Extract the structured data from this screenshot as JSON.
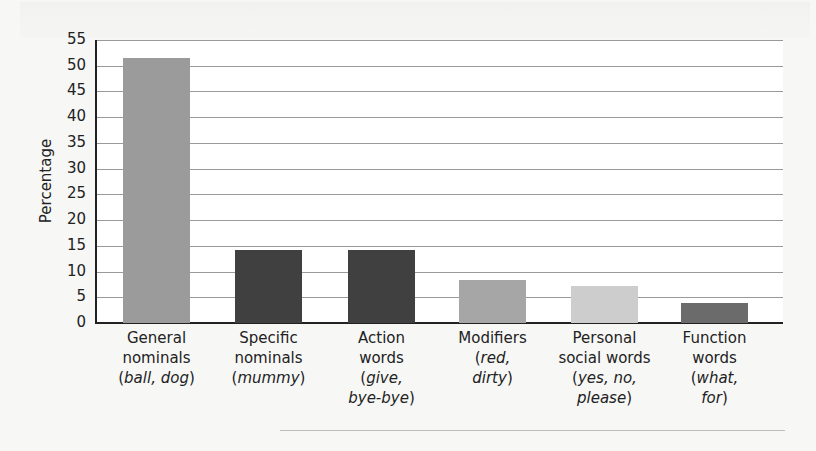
{
  "chart_data": {
    "type": "bar",
    "title": "",
    "xlabel": "",
    "ylabel": "Percentage",
    "ylim": [
      0,
      55
    ],
    "yticks": [
      0,
      5,
      10,
      15,
      20,
      25,
      30,
      35,
      40,
      45,
      50,
      55
    ],
    "grid": true,
    "legend": null,
    "categories": [
      "General nominals (ball, dog)",
      "Specific nominals (mummy)",
      "Action words (give, bye-bye)",
      "Modifiers (red, dirty)",
      "Personal social words (yes, no, please)",
      "Function words (what, for)"
    ],
    "values": [
      51.5,
      14.2,
      14.2,
      8.3,
      7.1,
      3.8
    ],
    "bar_colors": [
      "#9b9b9b",
      "#404040",
      "#404040",
      "#a6a6a6",
      "#cdcdcd",
      "#6b6b6b"
    ]
  },
  "axis": {
    "ylabel": "Percentage",
    "ticks": [
      "0",
      "5",
      "10",
      "15",
      "20",
      "25",
      "30",
      "35",
      "40",
      "45",
      "50",
      "55"
    ]
  },
  "categories": [
    {
      "line1": "General",
      "line2": "nominals",
      "ex_open": "(",
      "ex": "ball, dog",
      "ex_close": ")",
      "ex2": ""
    },
    {
      "line1": "Specific",
      "line2": "nominals",
      "ex_open": "(",
      "ex": "mummy",
      "ex_close": ")",
      "ex2": ""
    },
    {
      "line1": "Action",
      "line2": "words",
      "ex_open": "(",
      "ex": "give,",
      "ex_close": "",
      "ex2": "bye-bye"
    },
    {
      "line1": "Modifiers",
      "line2": "",
      "ex_open": "(",
      "ex": "red,",
      "ex_close": "",
      "ex2": "dirty"
    },
    {
      "line1": "Personal",
      "line2": "social words",
      "ex_open": "(",
      "ex": "yes, no,",
      "ex_close": "",
      "ex2": "please"
    },
    {
      "line1": "Function",
      "line2": "words",
      "ex_open": "(",
      "ex": "what,",
      "ex_close": "",
      "ex2": "for"
    }
  ]
}
